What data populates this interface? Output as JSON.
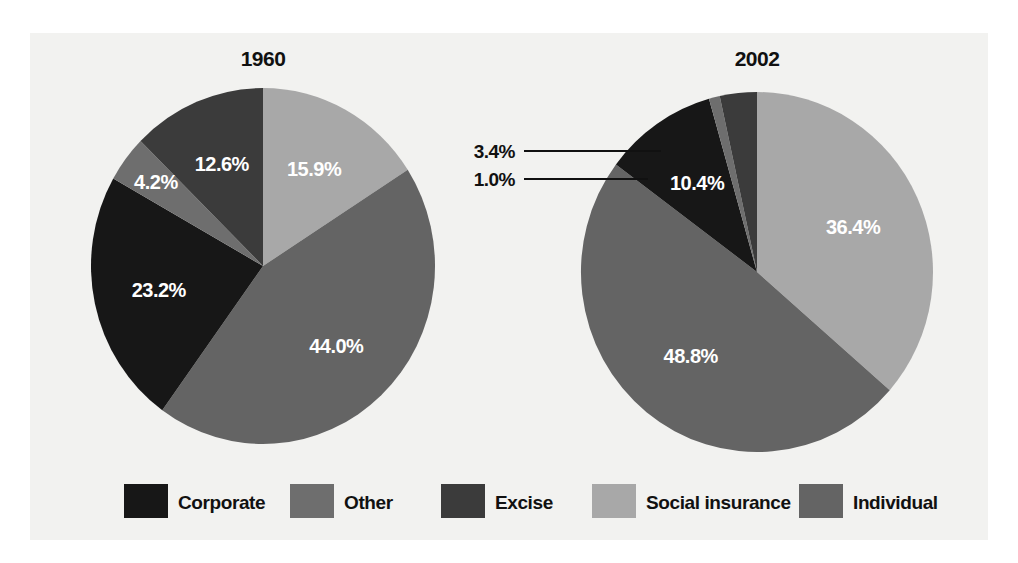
{
  "figure": {
    "background": "#ffffff",
    "panel_background": "#f2f2f0"
  },
  "legend": {
    "items": [
      {
        "label": "Corporate",
        "color": "#171717"
      },
      {
        "label": "Other",
        "color": "#6e6e6e"
      },
      {
        "label": "Excise",
        "color": "#3b3b3b"
      },
      {
        "label": "Social insurance",
        "color": "#a8a8a8"
      },
      {
        "label": "Individual",
        "color": "#646464"
      }
    ]
  },
  "chart_data": {
    "type": "pie",
    "title": "",
    "legend_position": "bottom",
    "categories": [
      "Social insurance",
      "Individual",
      "Corporate",
      "Other",
      "Excise"
    ],
    "colors": {
      "Corporate": "#171717",
      "Other": "#6e6e6e",
      "Excise": "#3b3b3b",
      "Social insurance": "#a8a8a8",
      "Individual": "#646464"
    },
    "charts": [
      {
        "title": "1960",
        "slices": [
          {
            "name": "Social insurance",
            "value": 15.9,
            "label": "15.9%",
            "color": "#a8a8a8",
            "label_style": "inside"
          },
          {
            "name": "Individual",
            "value": 44.0,
            "label": "44.0%",
            "color": "#646464",
            "label_style": "inside"
          },
          {
            "name": "Corporate",
            "value": 23.2,
            "label": "23.2%",
            "color": "#171717",
            "label_style": "inside"
          },
          {
            "name": "Other",
            "value": 4.2,
            "label": "4.2%",
            "color": "#6e6e6e",
            "label_style": "inside"
          },
          {
            "name": "Excise",
            "value": 12.6,
            "label": "12.6%",
            "color": "#3b3b3b",
            "label_style": "inside"
          }
        ]
      },
      {
        "title": "2002",
        "slices": [
          {
            "name": "Social insurance",
            "value": 36.4,
            "label": "36.4%",
            "color": "#a8a8a8",
            "label_style": "inside"
          },
          {
            "name": "Individual",
            "value": 48.8,
            "label": "48.8%",
            "color": "#646464",
            "label_style": "inside"
          },
          {
            "name": "Corporate",
            "value": 10.4,
            "label": "10.4%",
            "color": "#171717",
            "label_style": "inside"
          },
          {
            "name": "Other",
            "value": 1.0,
            "label": "1.0%",
            "color": "#6e6e6e",
            "label_style": "callout"
          },
          {
            "name": "Excise",
            "value": 3.4,
            "label": "3.4%",
            "color": "#3b3b3b",
            "label_style": "callout"
          }
        ]
      }
    ]
  },
  "labels": {
    "pie1_title": "1960",
    "pie2_title": "2002",
    "pie1_social": "15.9%",
    "pie1_individual": "44.0%",
    "pie1_corporate": "23.2%",
    "pie1_other": "4.2%",
    "pie1_excise": "12.6%",
    "pie2_social": "36.4%",
    "pie2_individual": "48.8%",
    "pie2_corporate": "10.4%",
    "pie2_other": "1.0%",
    "pie2_excise": "3.4%"
  }
}
